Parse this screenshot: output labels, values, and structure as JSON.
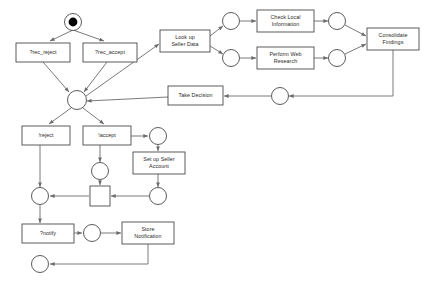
{
  "diagram": {
    "type": "petri-net",
    "background_color": "#ffffff",
    "stroke_color": "#4a4a4a",
    "arc_color": "#6b6b6b",
    "text_color": "#2b2b2b",
    "token_color": "#000000",
    "width": 429,
    "height": 283
  },
  "places": [
    {
      "id": "p_start",
      "cx": 73,
      "cy": 22,
      "r": 8.5,
      "marked": true,
      "token_r": 4.4
    },
    {
      "id": "p_central",
      "cx": 77,
      "cy": 100,
      "r": 9.5,
      "marked": false
    },
    {
      "id": "p_local_in",
      "cx": 231,
      "cy": 21,
      "r": 8.5,
      "marked": false
    },
    {
      "id": "p_web_in",
      "cx": 231,
      "cy": 58,
      "r": 8.5,
      "marked": false
    },
    {
      "id": "p_local_out",
      "cx": 337,
      "cy": 21,
      "r": 8.5,
      "marked": false
    },
    {
      "id": "p_web_out",
      "cx": 337,
      "cy": 58,
      "r": 8.5,
      "marked": false
    },
    {
      "id": "p_decision_in",
      "cx": 280,
      "cy": 96,
      "r": 8.5,
      "marked": false
    },
    {
      "id": "p_accept_out",
      "cx": 158,
      "cy": 136,
      "r": 8.5,
      "marked": false
    },
    {
      "id": "p_accept_down",
      "cx": 100,
      "cy": 171,
      "r": 8.5,
      "marked": false
    },
    {
      "id": "p_setup_out",
      "cx": 158,
      "cy": 196,
      "r": 8.5,
      "marked": false
    },
    {
      "id": "p_join",
      "cx": 40,
      "cy": 196,
      "r": 8.5,
      "marked": false
    },
    {
      "id": "p_notify_out",
      "cx": 92,
      "cy": 233,
      "r": 8.5,
      "marked": false
    },
    {
      "id": "p_end",
      "cx": 40,
      "cy": 264,
      "r": 8.5,
      "marked": false
    }
  ],
  "transitions": [
    {
      "id": "t_rec_reject",
      "label": "?rec_reject",
      "x": 16,
      "y": 43,
      "w": 54,
      "h": 19,
      "lines": [
        "?rec_reject"
      ]
    },
    {
      "id": "t_rec_accept",
      "label": "?rec_accept",
      "x": 83,
      "y": 43,
      "w": 54,
      "h": 19,
      "lines": [
        "?rec_accept"
      ]
    },
    {
      "id": "t_lookup",
      "label": "Look up Seller Data",
      "x": 160,
      "y": 30,
      "w": 50,
      "h": 22,
      "lines": [
        "Look up",
        "Seller Data"
      ]
    },
    {
      "id": "t_check_local",
      "label": "Check Local Information",
      "x": 257,
      "y": 10,
      "w": 57,
      "h": 22,
      "lines": [
        "Check Local",
        "Information"
      ]
    },
    {
      "id": "t_web_research",
      "label": "Perform Web Research",
      "x": 257,
      "y": 47,
      "w": 57,
      "h": 22,
      "lines": [
        "Perform Web",
        "Research"
      ]
    },
    {
      "id": "t_consolidate",
      "label": "Consolidate Findings",
      "x": 367,
      "y": 28,
      "w": 52,
      "h": 22,
      "lines": [
        "Consolidate",
        "Findings"
      ]
    },
    {
      "id": "t_take_decision",
      "label": "Take Decision",
      "x": 168,
      "y": 86,
      "w": 55,
      "h": 19,
      "lines": [
        "Take Decision"
      ]
    },
    {
      "id": "t_reject",
      "label": "!reject",
      "x": 22,
      "y": 126,
      "w": 48,
      "h": 19,
      "lines": [
        "!reject"
      ]
    },
    {
      "id": "t_accept",
      "label": "!accept",
      "x": 83,
      "y": 126,
      "w": 48,
      "h": 19,
      "lines": [
        "!accept"
      ]
    },
    {
      "id": "t_setup_seller",
      "label": "Set up Seller Account",
      "x": 133,
      "y": 152,
      "w": 52,
      "h": 22,
      "lines": [
        "Set up Seller",
        "Account"
      ]
    },
    {
      "id": "t_silent_join",
      "label": "",
      "x": 90,
      "y": 186,
      "w": 20,
      "h": 20,
      "lines": []
    },
    {
      "id": "t_notify",
      "label": "?notify",
      "x": 22,
      "y": 224,
      "w": 52,
      "h": 19,
      "lines": [
        "?notify"
      ]
    },
    {
      "id": "t_store_notif",
      "label": "Store Notification",
      "x": 122,
      "y": 222,
      "w": 52,
      "h": 22,
      "lines": [
        "Store",
        "Notification"
      ]
    }
  ],
  "arcs": [
    {
      "id": "a1",
      "from": "p_start",
      "to": "t_rec_reject",
      "points": "73,30 50,41",
      "arrow_at": "50,41",
      "angle": 154
    },
    {
      "id": "a2",
      "from": "p_start",
      "to": "t_rec_accept",
      "points": "73,30 104,41",
      "arrow_at": "104,41",
      "angle": 20
    },
    {
      "id": "a3",
      "from": "t_rec_reject",
      "to": "p_central",
      "points": "43,62 69,92",
      "arrow_at": "69,92",
      "angle": 49
    },
    {
      "id": "a4",
      "from": "t_rec_accept",
      "to": "p_central",
      "points": "107,62 84,92",
      "arrow_at": "84,92",
      "angle": 127
    },
    {
      "id": "a5",
      "from": "p_central",
      "to": "t_lookup",
      "points": "86,96 159,44",
      "arrow_at": "159,44",
      "angle": 325
    },
    {
      "id": "a6",
      "from": "t_lookup",
      "to": "p_local_in",
      "points": "210,36 223,26",
      "arrow_at": "223,26",
      "angle": 322
    },
    {
      "id": "a7",
      "from": "t_lookup",
      "to": "p_web_in",
      "points": "210,46 223,54",
      "arrow_at": "223,54",
      "angle": 32
    },
    {
      "id": "a8",
      "from": "p_local_in",
      "to": "t_check_local",
      "points": "240,21 256,21",
      "arrow_at": "256,21",
      "angle": 0
    },
    {
      "id": "a9",
      "from": "p_web_in",
      "to": "t_web_research",
      "points": "240,58 256,58",
      "arrow_at": "256,58",
      "angle": 0
    },
    {
      "id": "a10",
      "from": "t_check_local",
      "to": "p_local_out",
      "points": "314,21 328,21",
      "arrow_at": "328,21",
      "angle": 0
    },
    {
      "id": "a11",
      "from": "t_web_research",
      "to": "p_web_out",
      "points": "314,58 328,58",
      "arrow_at": "328,58",
      "angle": 0
    },
    {
      "id": "a12",
      "from": "p_local_out",
      "to": "t_consolidate",
      "points": "345,25 366,36",
      "arrow_at": "366,36",
      "angle": 28
    },
    {
      "id": "a13",
      "from": "p_web_out",
      "to": "t_consolidate",
      "points": "345,54 366,44",
      "arrow_at": "366,44",
      "angle": 334
    },
    {
      "id": "a14",
      "from": "t_consolidate",
      "to": "p_decision_in",
      "points": "393,50 393,96 289,96",
      "arrow_at": "289,96",
      "angle": 180
    },
    {
      "id": "a15",
      "from": "p_decision_in",
      "to": "t_take_decision",
      "points": "271,96 224,96",
      "arrow_at": "224,96",
      "angle": 180
    },
    {
      "id": "a16",
      "from": "t_take_decision",
      "to": "p_central",
      "points": "168,97 87,101",
      "arrow_at": "87,101",
      "angle": 177
    },
    {
      "id": "a17",
      "from": "p_central",
      "to": "t_reject",
      "points": "71,108 49,124",
      "arrow_at": "49,124",
      "angle": 144
    },
    {
      "id": "a18",
      "from": "p_central",
      "to": "t_accept",
      "points": "83,108 104,124",
      "arrow_at": "104,124",
      "angle": 37
    },
    {
      "id": "a19",
      "from": "t_accept",
      "to": "p_accept_out",
      "points": "131,136 148,136",
      "arrow_at": "148,136",
      "angle": 0
    },
    {
      "id": "a20",
      "from": "t_accept",
      "to": "p_accept_down",
      "points": "100,145 100,162",
      "arrow_at": "100,162",
      "angle": 90
    },
    {
      "id": "a21",
      "from": "p_accept_out",
      "to": "t_setup_seller",
      "points": "158,145 158,151",
      "arrow_at": "158,151",
      "angle": 90
    },
    {
      "id": "a22",
      "from": "t_setup_seller",
      "to": "p_setup_out",
      "points": "158,174 158,187",
      "arrow_at": "158,187",
      "angle": 90
    },
    {
      "id": "a23",
      "from": "p_accept_down",
      "to": "t_silent_join",
      "points": "100,180 100,185",
      "arrow_at": "100,185",
      "angle": 90
    },
    {
      "id": "a24",
      "from": "p_setup_out",
      "to": "t_silent_join",
      "points": "149,196 111,196",
      "arrow_at": "111,196",
      "angle": 180
    },
    {
      "id": "a25",
      "from": "t_silent_join",
      "to": "p_join",
      "points": "89,196 50,196",
      "arrow_at": "50,196",
      "angle": 180
    },
    {
      "id": "a26",
      "from": "t_reject",
      "to": "p_join",
      "points": "40,145 40,187",
      "arrow_at": "40,187",
      "angle": 90
    },
    {
      "id": "a27",
      "from": "p_join",
      "to": "t_notify",
      "points": "40,205 40,223",
      "arrow_at": "40,223",
      "angle": 90
    },
    {
      "id": "a28",
      "from": "t_notify",
      "to": "p_notify_out",
      "points": "74,233 82,233",
      "arrow_at": "82,233",
      "angle": 0
    },
    {
      "id": "a29",
      "from": "p_notify_out",
      "to": "t_store_notif",
      "points": "101,233 121,233",
      "arrow_at": "121,233",
      "angle": 0
    },
    {
      "id": "a30",
      "from": "t_store_notif",
      "to": "p_end",
      "points": "148,244 148,264 50,264",
      "arrow_at": "50,264",
      "angle": 180
    }
  ]
}
